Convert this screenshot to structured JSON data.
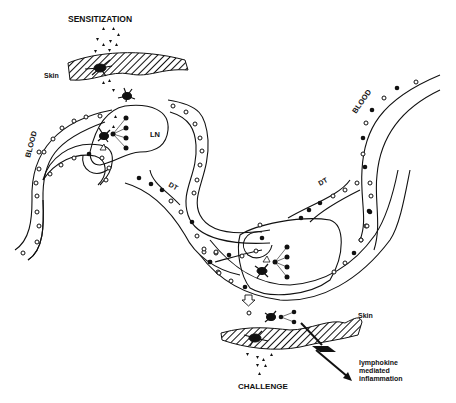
{
  "labels": {
    "sensitization": "SENSITIZATION",
    "skin_top": "Skin",
    "blood_left": "BLOOD",
    "ln": "LN",
    "dt_left": "DT",
    "dt_right": "DT",
    "blood_right": "BLOOD",
    "skin_bottom": "Skin",
    "challenge": "CHALLENGE",
    "outcome_line1": "lymphokine",
    "outcome_line2": "mediated",
    "outcome_line3": "inflammation"
  },
  "legend_semantics": {
    "open_circle": "lymphocyte (naive)",
    "filled_circle": "sensitized lymphocyte",
    "triangle": "antigen",
    "star_cell": "Langerhans / antigen-presenting cell"
  },
  "colors": {
    "ink": "#111111",
    "background": "#ffffff"
  }
}
